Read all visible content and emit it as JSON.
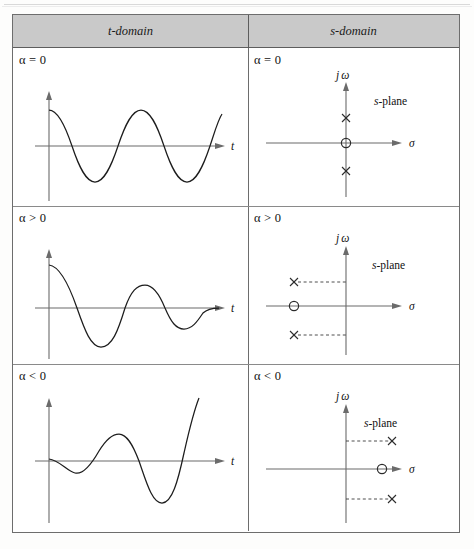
{
  "figure": {
    "kind": "table-of-plots",
    "header": {
      "col1": "t-domain",
      "col2": "s-domain"
    },
    "rows": [
      {
        "condition_t": "α = 0",
        "condition_s": "α = 0",
        "t_plot": {
          "type": "line",
          "description": "undamped sinusoid",
          "xlabel": "t",
          "ylabel": "",
          "amplitude_envelope": "constant",
          "cycles": 3
        },
        "s_plot": {
          "type": "scatter",
          "plane_label": "s-plane",
          "xlabel": "σ",
          "ylabel": "jω",
          "poles": [
            {
              "sigma": 0,
              "jomega": 1,
              "marker": "x"
            },
            {
              "sigma": 0,
              "jomega": -1,
              "marker": "x"
            }
          ],
          "zeros": [
            {
              "sigma": 0,
              "jomega": 0,
              "marker": "o"
            }
          ],
          "dashed_guides": false
        }
      },
      {
        "condition_t": "α > 0",
        "condition_s": "α > 0",
        "t_plot": {
          "type": "line",
          "description": "damped decaying sinusoid",
          "xlabel": "t",
          "ylabel": "",
          "amplitude_envelope": "decaying",
          "cycles": 2.5
        },
        "s_plot": {
          "type": "scatter",
          "plane_label": "s-plane",
          "xlabel": "σ",
          "ylabel": "jω",
          "poles": [
            {
              "sigma": -1,
              "jomega": 1,
              "marker": "x"
            },
            {
              "sigma": -1,
              "jomega": -1,
              "marker": "x"
            }
          ],
          "zeros": [
            {
              "sigma": -1,
              "jomega": 0,
              "marker": "o"
            }
          ],
          "dashed_guides": true
        }
      },
      {
        "condition_t": "α < 0",
        "condition_s": "α < 0",
        "t_plot": {
          "type": "line",
          "description": "growing unstable sinusoid",
          "xlabel": "t",
          "ylabel": "",
          "amplitude_envelope": "growing",
          "cycles": 2.5
        },
        "s_plot": {
          "type": "scatter",
          "plane_label": "s-plane",
          "xlabel": "σ",
          "ylabel": "jω",
          "poles": [
            {
              "sigma": 1,
              "jomega": 1,
              "marker": "x"
            },
            {
              "sigma": 1,
              "jomega": -1,
              "marker": "x"
            }
          ],
          "zeros": [
            {
              "sigma": 1,
              "jomega": 0,
              "marker": "o"
            }
          ],
          "dashed_guides": true
        }
      }
    ],
    "axis_labels": {
      "time": "t",
      "sigma": "σ",
      "jomega_j": "j",
      "jomega_w": "ω",
      "splane_s": "s",
      "splane_rest": "-plane"
    },
    "colors": {
      "header_fill": "#c9c9c9",
      "border": "#6d6d6d",
      "curve": "#1d1d1d",
      "axis": "#6b6b6b"
    }
  }
}
